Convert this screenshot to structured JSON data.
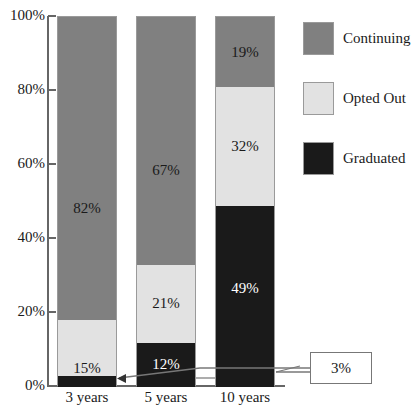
{
  "chart_data": {
    "type": "bar",
    "subtype": "stacked-percentage",
    "title": "",
    "xlabel": "",
    "ylabel": "",
    "categories": [
      "3 years",
      "5 years",
      "10 years"
    ],
    "series": [
      {
        "name": "Graduated",
        "color": "#1a1a1a",
        "values": [
          3,
          12,
          49
        ]
      },
      {
        "name": "Opted Out",
        "color": "#e2e2e2",
        "values": [
          15,
          21,
          32
        ]
      },
      {
        "name": "Continuing",
        "color": "#808080",
        "values": [
          82,
          67,
          19
        ]
      }
    ],
    "stack_order_bottom_to_top": [
      "Graduated",
      "Opted Out",
      "Continuing"
    ],
    "ylim": [
      0,
      100
    ],
    "yticks": [
      0,
      20,
      40,
      60,
      80,
      100
    ],
    "ytick_labels": [
      "0%",
      "20%",
      "40%",
      "60%",
      "80%",
      "100%"
    ],
    "grid": false,
    "legend_position": "right",
    "data_labels": {
      "3 years": {
        "Continuing": "82%",
        "Opted Out": "15%",
        "Graduated": ""
      },
      "5 years": {
        "Continuing": "67%",
        "Opted Out": "21%",
        "Graduated": "12%"
      },
      "10 years": {
        "Continuing": "19%",
        "Opted Out": "32%",
        "Graduated": "49%"
      }
    },
    "annotations": [
      {
        "text": "3%",
        "points_to": "Graduated segment of 3 years bar",
        "style": "boxed-callout-with-leader-line"
      }
    ]
  },
  "axis": {
    "ticks": [
      {
        "label": "100%",
        "value": 100
      },
      {
        "label": "80%",
        "value": 80
      },
      {
        "label": "60%",
        "value": 60
      },
      {
        "label": "40%",
        "value": 40
      },
      {
        "label": "20%",
        "value": 20
      },
      {
        "label": "0%",
        "value": 0
      }
    ]
  },
  "bars": [
    {
      "category": "3 years",
      "segments": [
        {
          "series": "Continuing",
          "value": 82,
          "label": "82%",
          "color": "#808080",
          "label_color": "#1a1a1a"
        },
        {
          "series": "Opted Out",
          "value": 15,
          "label": "15%",
          "color": "#e2e2e2",
          "label_color": "#1a1a1a"
        },
        {
          "series": "Graduated",
          "value": 3,
          "label": "",
          "color": "#1a1a1a",
          "label_color": "#ffffff"
        }
      ]
    },
    {
      "category": "5 years",
      "segments": [
        {
          "series": "Continuing",
          "value": 67,
          "label": "67%",
          "color": "#808080",
          "label_color": "#1a1a1a"
        },
        {
          "series": "Opted Out",
          "value": 21,
          "label": "21%",
          "color": "#e2e2e2",
          "label_color": "#1a1a1a"
        },
        {
          "series": "Graduated",
          "value": 12,
          "label": "12%",
          "color": "#1a1a1a",
          "label_color": "#ffffff"
        }
      ]
    },
    {
      "category": "10 years",
      "segments": [
        {
          "series": "Continuing",
          "value": 19,
          "label": "19%",
          "color": "#808080",
          "label_color": "#1a1a1a"
        },
        {
          "series": "Opted Out",
          "value": 32,
          "label": "32%",
          "color": "#e2e2e2",
          "label_color": "#1a1a1a"
        },
        {
          "series": "Graduated",
          "value": 49,
          "label": "49%",
          "color": "#1a1a1a",
          "label_color": "#ffffff"
        }
      ]
    }
  ],
  "legend": {
    "items": [
      {
        "label": "Continuing",
        "color": "#808080"
      },
      {
        "label": "Opted Out",
        "color": "#e2e2e2"
      },
      {
        "label": "Graduated",
        "color": "#1a1a1a"
      }
    ]
  },
  "callout": {
    "value": "3%"
  },
  "colors": {
    "continuing": "#808080",
    "opted_out": "#e2e2e2",
    "graduated": "#1a1a1a",
    "axis": "#666666",
    "leader": "#777777",
    "background": "#ffffff"
  }
}
